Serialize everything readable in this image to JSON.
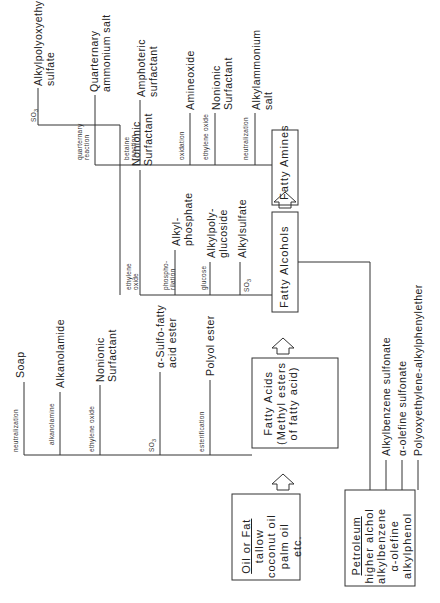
{
  "diagram": {
    "type": "flowchart",
    "orientation": "rotated-90-ccw",
    "sources": {
      "oil_or_fat": {
        "title": "Oil or Fat",
        "items": [
          "tallow",
          "coconut oil",
          "palm oil",
          "etc."
        ]
      },
      "petroleum": {
        "title": "Petroleum",
        "items": [
          "higher alchol",
          "alkylbenzene",
          "α-olefine",
          "alkylphenol"
        ]
      }
    },
    "intermediates": {
      "fatty_acids": {
        "line1": "Fatty Acids",
        "line2": "(Methyl esters",
        "line3": "of fatty acid)"
      },
      "fatty_alcohols": "Fatty Alcohols",
      "fatty_amines": "Fatty Amines"
    },
    "fatty_acid_branches": [
      {
        "reaction": "neutralization",
        "product": "Soap"
      },
      {
        "reaction": "alkanolamine",
        "product": "Alkanolamide"
      },
      {
        "reaction": "ethylene oxide",
        "product_l1": "Nonionic",
        "product_l2": "Surfactant"
      },
      {
        "reaction": "SO3",
        "product_l1": "α-Sulfo-fatty",
        "product_l2": "acid ester"
      },
      {
        "reaction": "esterification",
        "product": "Polyol ester"
      }
    ],
    "fatty_alcohol_branches": [
      {
        "reaction": "SO3",
        "product_l1": "Alkylpolyoxyethylene",
        "product_l2": "sulfate"
      },
      {
        "reaction_l1": "ethylene",
        "reaction_l2": "oxide",
        "product_l1": "Nonionic",
        "product_l2": "Surfactant"
      },
      {
        "reaction_l1": "phospho-",
        "reaction_l2": "rilation",
        "product_l1": "Alkyl-",
        "product_l2": "phosphate"
      },
      {
        "reaction": "glucose",
        "product_l1": "Alkylpoly-",
        "product_l2": "glucoside"
      },
      {
        "reaction": "SO3",
        "product": "Alkylsulfate"
      }
    ],
    "fatty_amine_branches": [
      {
        "reaction_l1": "quarternary",
        "reaction_l2": "reaction",
        "product_l1": "Quarternary",
        "product_l2": "ammonium salt"
      },
      {
        "reaction_l1": "betaine",
        "reaction_l2": "reaction",
        "product_l1": "Amphoteric",
        "product_l2": "surfactant"
      },
      {
        "reaction": "oxidation",
        "product": "Amineoxide"
      },
      {
        "reaction": "ethylene oxide",
        "product_l1": "Nonionic",
        "product_l2": "Surfactant"
      },
      {
        "reaction": "neutralization",
        "product_l1": "Alkylammonium",
        "product_l2": "salt"
      }
    ],
    "petroleum_products": [
      "Alkylbenzene sulfonate",
      "α-olefine sulfonate",
      "Polyoxyethylene-alkylphenylether"
    ]
  }
}
